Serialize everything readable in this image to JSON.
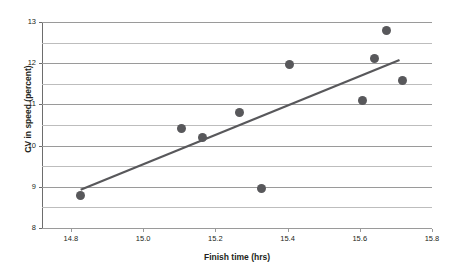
{
  "chart_data": {
    "type": "scatter",
    "title": "",
    "xlabel": "Finish time (hrs)",
    "ylabel": "CV in speed (percent)",
    "xlim": [
      14.72,
      15.8
    ],
    "ylim": [
      8,
      13
    ],
    "x_ticks": [
      14.8,
      15.0,
      15.2,
      15.4,
      15.6,
      15.8
    ],
    "x_tick_labels": [
      "14.8",
      "15.0",
      "15.2",
      "15.4",
      "15.6",
      "15.8"
    ],
    "y_ticks": [
      8,
      9,
      10,
      11,
      12,
      13
    ],
    "y_tick_labels": [
      "8",
      "9",
      "10",
      "11",
      "12",
      "13"
    ],
    "y_gridlines_major": [
      8,
      9,
      10,
      11,
      12,
      13
    ],
    "y_gridlines_minor": [
      8.5,
      9.5,
      10.5,
      11.5,
      12.5
    ],
    "grid": true,
    "legend": null,
    "points": [
      {
        "x": 14.827,
        "y": 8.78
      },
      {
        "x": 15.107,
        "y": 10.41
      },
      {
        "x": 15.164,
        "y": 10.2
      },
      {
        "x": 15.268,
        "y": 10.8
      },
      {
        "x": 15.328,
        "y": 8.95
      },
      {
        "x": 15.405,
        "y": 11.97
      },
      {
        "x": 15.608,
        "y": 11.1
      },
      {
        "x": 15.641,
        "y": 12.12
      },
      {
        "x": 15.673,
        "y": 12.8
      },
      {
        "x": 15.717,
        "y": 11.58
      }
    ],
    "trend_line": {
      "type": "linear-fit",
      "x_start": 14.827,
      "y_start": 8.93,
      "x_end": 15.71,
      "y_end": 12.08
    },
    "marker_color": "#58585b",
    "line_color": "#58585b",
    "grid_color": "#9a9a9a",
    "background_color": "#ffffff"
  }
}
